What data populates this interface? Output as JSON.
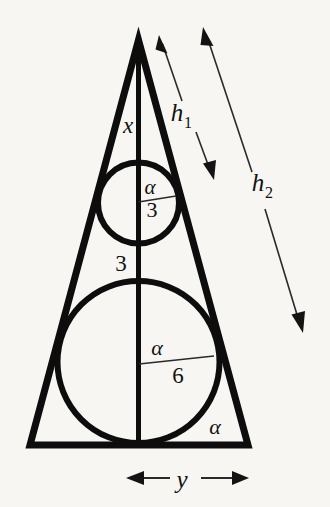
{
  "figure": {
    "canvas": {
      "width": 330,
      "height": 507
    },
    "background_color": "#f7f6f3",
    "ink_color": "#0d0d0d",
    "thin_ink_color": "#2a2a2a"
  },
  "triangle": {
    "apex": {
      "x": 138.5,
      "y": 40
    },
    "base_left": {
      "x": 30,
      "y": 445
    },
    "base_right": {
      "x": 248,
      "y": 445
    },
    "stroke_width": 7,
    "axis": {
      "label": "axis-of-symmetry",
      "from": {
        "x": 138.5,
        "y": 40
      },
      "to": {
        "x": 138.5,
        "y": 445
      },
      "stroke_width": 5
    }
  },
  "circles": [
    {
      "name": "small-circle",
      "cx": 138.5,
      "cy": 203,
      "r": 40.5,
      "stroke_width": 6,
      "radius_label": "3",
      "angle_label": "α"
    },
    {
      "name": "large-circle",
      "cx": 138.5,
      "cy": 362,
      "r": 81,
      "stroke_width": 6,
      "radius_label": "6",
      "angle_label": "α"
    }
  ],
  "radius_lines": [
    {
      "name": "small-circle-radius",
      "from": {
        "x": 138.5,
        "y": 202
      },
      "to": {
        "x": 176,
        "y": 196
      },
      "stroke_width": 1.4
    },
    {
      "name": "large-circle-radius",
      "from": {
        "x": 139,
        "y": 364
      },
      "to": {
        "x": 214,
        "y": 356
      },
      "stroke_width": 1.4
    }
  ],
  "labels": {
    "apex_segment": {
      "text": "x",
      "x": 128,
      "y": 133,
      "size": 23,
      "style": "italic"
    },
    "small_circle_angle": {
      "text": "α",
      "x": 150,
      "y": 194,
      "size": 21,
      "style": "italic"
    },
    "small_circle_radius": {
      "text": "3",
      "x": 152,
      "y": 217,
      "size": 22,
      "style": "upright"
    },
    "between_circles": {
      "text": "3",
      "x": 121,
      "y": 271,
      "size": 23,
      "style": "upright"
    },
    "large_circle_angle": {
      "text": "α",
      "x": 157,
      "y": 355,
      "size": 22,
      "style": "italic"
    },
    "large_circle_radius": {
      "text": "6",
      "x": 178,
      "y": 383,
      "size": 23,
      "style": "upright"
    },
    "base_angle": {
      "text": "α",
      "x": 215,
      "y": 434,
      "size": 22,
      "style": "italic"
    },
    "height_one": {
      "text": "h",
      "sub": "1",
      "x": 177,
      "y": 121,
      "size": 25,
      "style": "italic"
    },
    "height_two": {
      "text": "h",
      "sub": "2",
      "x": 258,
      "y": 191,
      "size": 25,
      "style": "italic"
    },
    "base_dimension": {
      "text": "y",
      "x": 182,
      "y": 488,
      "size": 25,
      "style": "italic"
    }
  },
  "dimension_arrows": [
    {
      "name": "h1-double-arrow",
      "label": "h₁",
      "upper_tip": {
        "x": 159,
        "y": 35
      },
      "upper_tail": {
        "x": 182,
        "y": 101
      },
      "lower_tail": {
        "x": 196,
        "y": 132
      },
      "lower_tip": {
        "x": 214,
        "y": 180
      },
      "stroke_width": 1.6
    },
    {
      "name": "h2-double-arrow",
      "label": "h₂",
      "upper_tip": {
        "x": 203,
        "y": 27
      },
      "upper_tail": {
        "x": 252,
        "y": 172
      },
      "lower_tail": {
        "x": 265,
        "y": 209
      },
      "lower_tip": {
        "x": 303,
        "y": 333
      },
      "stroke_width": 1.6
    },
    {
      "name": "y-double-arrow",
      "label": "y",
      "left_tip": {
        "x": 126,
        "y": 478
      },
      "left_tail": {
        "x": 168,
        "y": 478
      },
      "right_tail": {
        "x": 203,
        "y": 478
      },
      "right_tip": {
        "x": 249,
        "y": 478
      },
      "stroke_width": 2.2
    }
  ],
  "geometry_values": {
    "small_radius": "3",
    "large_radius": "6",
    "gap_between_circles": "3",
    "apex_to_small_circle": "x",
    "half_base": "y",
    "slant_to_small_tangent": "h₁",
    "slant_full": "h₂",
    "half_apex_angle": "α"
  }
}
